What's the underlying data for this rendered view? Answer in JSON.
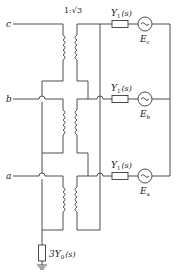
{
  "diagram": {
    "type": "circuit",
    "title": "",
    "ratio_label": "1:√3",
    "terminals": [
      {
        "id": "c",
        "label": "c"
      },
      {
        "id": "b",
        "label": "b"
      },
      {
        "id": "a",
        "label": "a"
      }
    ],
    "branches": [
      {
        "phase": "c",
        "admittance": "Y",
        "admittance_sub": "1",
        "admittance_arg": "(s)",
        "source": "E",
        "source_sub": "c"
      },
      {
        "phase": "b",
        "admittance": "Y",
        "admittance_sub": "1",
        "admittance_arg": "(s)",
        "source": "E",
        "source_sub": "b"
      },
      {
        "phase": "a",
        "admittance": "Y",
        "admittance_sub": "1",
        "admittance_arg": "(s)",
        "source": "E",
        "source_sub": "a"
      }
    ],
    "ground_admittance": {
      "prefix": "3Y",
      "sub": "0",
      "arg": "(s)"
    },
    "colors": {
      "line": "#3a3a3a",
      "background": "#ffffff"
    }
  }
}
